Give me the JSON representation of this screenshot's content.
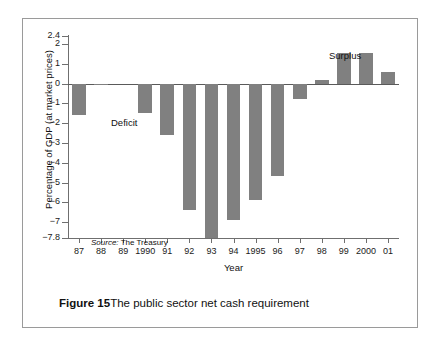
{
  "figure": {
    "caption_label": "Figure 15",
    "caption_text": "The public sector net cash requirement",
    "source_word": "Source:",
    "source_value": "The Treasury",
    "deficit_label": "Deficit",
    "surplus_label": "Surplus",
    "bar_color": "#808080",
    "axis_color": "#6f6f6f"
  },
  "chart_data": {
    "type": "bar",
    "title": "The public sector net cash requirement",
    "xlabel": "Year",
    "ylabel": "Percentage of GDP (at market prices)",
    "ylim": [
      -7.8,
      2.4
    ],
    "grid": false,
    "legend": null,
    "categories": [
      "87",
      "88",
      "89",
      "1990",
      "91",
      "92",
      "93",
      "94",
      "1995",
      "96",
      "97",
      "98",
      "99",
      "2000",
      "01"
    ],
    "values": [
      -1.6,
      -0.1,
      0.0,
      -1.5,
      -2.6,
      -6.4,
      -7.8,
      -6.9,
      -5.9,
      -4.65,
      -0.8,
      0.2,
      1.55,
      1.55,
      0.6
    ],
    "ytick_labels": [
      "2.4",
      "2",
      "1",
      "0",
      "-1",
      "-2",
      "-3",
      "-4",
      "-5",
      "-6",
      "-7",
      "-7.8"
    ],
    "ytick_values": [
      2.4,
      2,
      1,
      0,
      -1,
      -2,
      -3,
      -4,
      -5,
      -6,
      -7,
      -7.8
    ],
    "annotations": [
      {
        "text": "Deficit",
        "region": "below-zero-left"
      },
      {
        "text": "Surplus",
        "region": "above-zero-right"
      },
      {
        "text": "Source: The Treasury",
        "region": "inside-plot-bottom-left"
      }
    ]
  }
}
